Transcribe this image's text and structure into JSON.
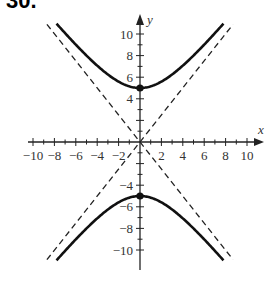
{
  "problem_label": "30.",
  "chart_data": {
    "type": "line",
    "title": "",
    "equation": "y^2/25 - x^2/16 = 1",
    "xlabel": "x",
    "ylabel": "y",
    "xlim": [
      -10,
      10
    ],
    "ylim": [
      -10,
      10
    ],
    "xticks": [
      -10,
      -8,
      -6,
      -4,
      -2,
      2,
      4,
      6,
      8,
      10
    ],
    "yticks": [
      -10,
      -8,
      -6,
      -4,
      4,
      6,
      8,
      10
    ],
    "series": [
      {
        "name": "upper branch",
        "style": "solid",
        "x": [
          -7.8,
          -6,
          -4,
          -2,
          0,
          2,
          4,
          6,
          7.8
        ],
        "values": [
          10.9,
          9.6,
          8.0,
          6.5,
          5,
          6.5,
          8.0,
          9.6,
          10.9
        ]
      },
      {
        "name": "lower branch",
        "style": "solid",
        "x": [
          -7.8,
          -6,
          -4,
          -2,
          0,
          2,
          4,
          6,
          7.8
        ],
        "values": [
          -10.9,
          -9.6,
          -8.0,
          -6.5,
          -5,
          -6.5,
          -8.0,
          -9.6,
          -10.9
        ]
      },
      {
        "name": "asymptote y = 5x/4",
        "style": "dashed",
        "x": [
          -8.7,
          8.7
        ],
        "values": [
          -10.9,
          10.9
        ]
      },
      {
        "name": "asymptote y = -5x/4",
        "style": "dashed",
        "x": [
          -8.7,
          8.7
        ],
        "values": [
          10.9,
          -10.9
        ]
      }
    ],
    "points": [
      {
        "x": 0,
        "y": 5,
        "label": "vertex"
      },
      {
        "x": 0,
        "y": -5,
        "label": "vertex"
      }
    ],
    "grid": false,
    "legend": null
  }
}
